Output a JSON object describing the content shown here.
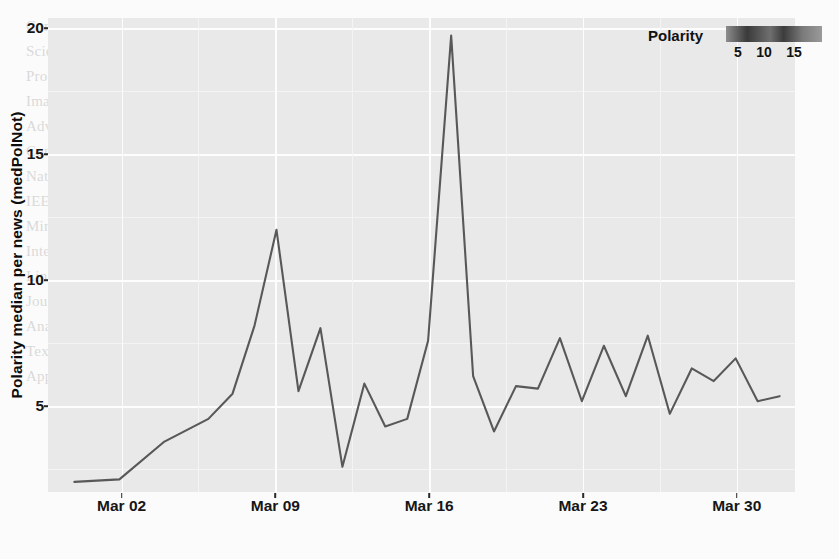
{
  "chart_data": {
    "type": "line",
    "title": "",
    "xlabel": "",
    "ylabel": "Polarity median per news (medPolNot)",
    "xlim": [
      0,
      34
    ],
    "ylim": [
      1.6,
      20.4
    ],
    "grid": true,
    "x_tick_labels": [
      "Mar 02",
      "Mar 09",
      "Mar 16",
      "Mar 23",
      "Mar 30"
    ],
    "x_tick_positions": [
      3.35,
      10.35,
      17.35,
      24.35,
      31.35
    ],
    "y_tick_labels": [
      "20",
      "15",
      "10",
      "5"
    ],
    "y_tick_values": [
      20,
      15,
      10,
      5
    ],
    "series": [
      {
        "name": "medPolNot",
        "x": [
          1.2,
          3.25,
          5.3,
          7.3,
          8.4,
          9.4,
          10.4,
          11.4,
          12.4,
          13.4,
          14.4,
          15.35,
          16.35,
          17.3,
          18.35,
          19.35,
          20.3,
          21.3,
          22.3,
          23.3,
          24.3,
          25.3,
          26.3,
          27.3,
          28.3,
          29.3,
          30.3,
          31.3,
          32.3,
          33.3
        ],
        "values": [
          2.0,
          2.1,
          3.6,
          4.5,
          5.5,
          8.2,
          12.0,
          5.6,
          8.1,
          2.6,
          5.9,
          4.2,
          4.5,
          7.6,
          19.7,
          6.2,
          4.0,
          5.8,
          5.7,
          7.7,
          5.2,
          7.4,
          5.4,
          7.8,
          4.7,
          6.5,
          6.0,
          6.9,
          5.2,
          5.4
        ]
      }
    ],
    "colorbar": {
      "title": "Polarity",
      "tick_labels": [
        "5",
        "10",
        "15"
      ],
      "tick_values": [
        5,
        10,
        15
      ],
      "orientation": "horizontal",
      "gradient_dark": "#3a3a3a",
      "gradient_light": "#9a9a9a"
    },
    "style": {
      "panel_background": "#e9e9e9",
      "gridline_color": "#fdfdfd",
      "line_color": "#585858",
      "axis_text_color": "#161616"
    }
  },
  "background_text": {
    "lines": [
      "Computer Science, vol. 1, pp. 1-12, 2020.",
      "Scientific Journal of Research and Reviews",
      "Proceedings of the International Conference",
      "Image Processing and Pattern Classification",
      "Advances in Data Science for the Humanities",
      "Conference on Artificial Intelligence",
      "Natural Language Processing Workshop",
      "IEEE Transactions on Knowledge and Data",
      "Mining Social Media Streams for Sentiment",
      "International Conference on Computational",
      "Linguistics, 2019.",
      "Journal of Information Retrieval Studies",
      "Analysis of Polarity in News Articles",
      "Text Mining and Opinion Summarization",
      "Applied Machine Learning Review, 2021."
    ]
  }
}
